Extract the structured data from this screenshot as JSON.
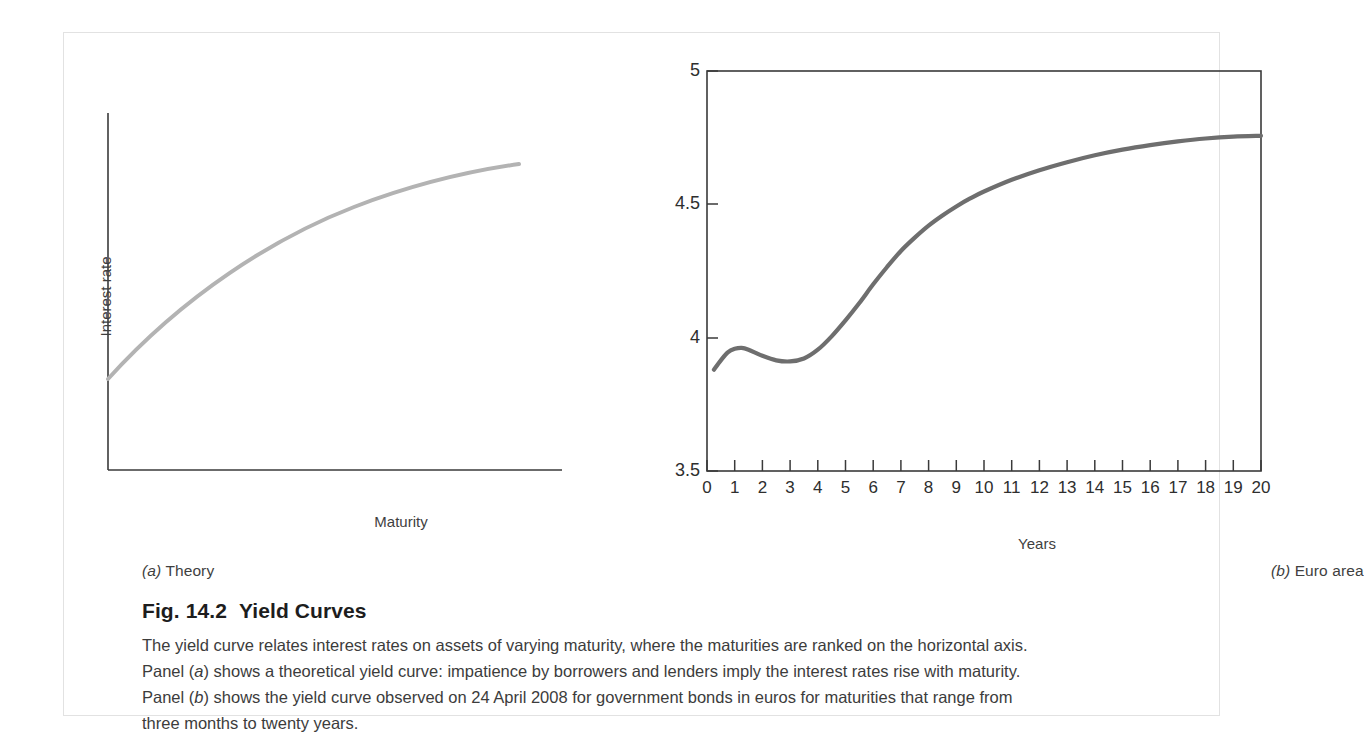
{
  "figure": {
    "number": "Fig. 14.2",
    "title": "Yield Curves",
    "caption_lines": [
      "The yield curve relates interest rates on assets of varying maturity, where the maturities are ranked on the horizontal axis.",
      "Panel (a) shows a theoretical yield curve: impatience by borrowers and lenders imply the interest rates rise with maturity.",
      "Panel (b) shows the yield curve observed on 24 April 2008 for government bonds in euros for maturities that range from",
      "three months to twenty years."
    ]
  },
  "panel_a": {
    "caption_prefix": "(a)",
    "caption_text": "Theory",
    "ylabel": "Interest rate",
    "xlabel": "Maturity"
  },
  "panel_b": {
    "caption_prefix": "(b)",
    "caption_text": "Euro area",
    "xlabel": "Years"
  },
  "colors": {
    "curve_theory": "#b3b3b3",
    "curve_euro": "#6e6e6e",
    "axis": "#3a3a3a",
    "frame": "#e2e2e2",
    "text": "#3c3c3c"
  },
  "chart_data": [
    {
      "type": "line",
      "id": "panel-a-theory",
      "title": "(a) Theory",
      "xlabel": "Maturity",
      "ylabel": "Interest rate",
      "xlim": [
        0,
        10
      ],
      "ylim": [
        0,
        10
      ],
      "grid": false,
      "legend": "none",
      "axis_ticks": false,
      "series": [
        {
          "name": "Theoretical yield curve",
          "color": "#b3b3b3",
          "x": [
            0,
            0.5,
            1,
            1.5,
            2,
            2.5,
            3,
            3.5,
            4,
            4.5,
            5,
            5.5,
            6,
            6.5,
            7,
            7.5,
            8,
            8.5,
            9,
            9.5,
            10
          ],
          "y": [
            2.55,
            3.35,
            4.05,
            4.65,
            5.18,
            5.64,
            6.05,
            6.42,
            6.75,
            7.05,
            7.32,
            7.56,
            7.78,
            7.98,
            8.16,
            8.33,
            8.48,
            8.62,
            8.75,
            8.87,
            8.98
          ]
        }
      ],
      "annotations": [
        "Curve is concave: interest rate rises with maturity at a decreasing rate"
      ]
    },
    {
      "type": "line",
      "id": "panel-b-euro-area",
      "title": "(b) Euro area",
      "subtitle": "Yield curve observed on 24 April 2008 for government bonds in euros",
      "xlabel": "Years",
      "ylabel": "",
      "xlim": [
        0,
        20
      ],
      "ylim": [
        3.5,
        5
      ],
      "yticks": [
        3.5,
        4,
        4.5,
        5
      ],
      "ytick_labels": [
        "3.5",
        "4",
        "4.5",
        "5"
      ],
      "xticks": [
        0,
        1,
        2,
        3,
        4,
        5,
        6,
        7,
        8,
        9,
        10,
        11,
        12,
        13,
        14,
        15,
        16,
        17,
        18,
        19,
        20
      ],
      "xtick_labels": [
        "0",
        "1",
        "2",
        "3",
        "4",
        "5",
        "6",
        "7",
        "8",
        "9",
        "10",
        "11",
        "12",
        "13",
        "14",
        "15",
        "16",
        "17",
        "18",
        "19",
        "20"
      ],
      "grid": false,
      "legend": "none",
      "tick_direction": "in",
      "series": [
        {
          "name": "Euro area yield curve (24 April 2008)",
          "color": "#6e6e6e",
          "x": [
            0.25,
            0.5,
            0.75,
            1,
            1.25,
            1.5,
            2,
            2.5,
            3,
            3.5,
            4,
            4.5,
            5,
            5.5,
            6,
            6.5,
            7,
            7.5,
            8,
            8.5,
            9,
            9.5,
            10,
            11,
            12,
            13,
            14,
            15,
            16,
            17,
            18,
            19,
            20
          ],
          "y": [
            3.88,
            3.915,
            3.945,
            3.958,
            3.962,
            3.955,
            3.932,
            3.915,
            3.911,
            3.922,
            3.955,
            4.005,
            4.065,
            4.13,
            4.2,
            4.265,
            4.325,
            4.375,
            4.42,
            4.458,
            4.492,
            4.522,
            4.548,
            4.592,
            4.628,
            4.658,
            4.684,
            4.705,
            4.722,
            4.736,
            4.747,
            4.754,
            4.757
          ]
        }
      ]
    }
  ]
}
